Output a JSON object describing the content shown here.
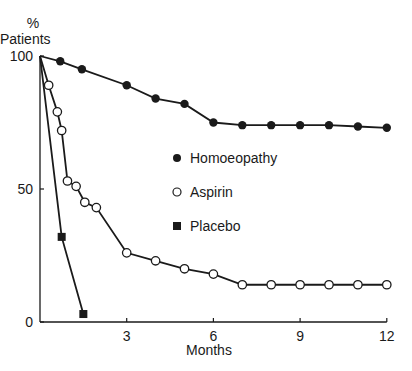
{
  "chart_data": {
    "type": "line",
    "title": "",
    "xlabel": "Months",
    "ylabel": "% Patients",
    "ylabel_line1": "%",
    "ylabel_line2": "Patients",
    "xlim": [
      0,
      12
    ],
    "ylim": [
      0,
      100
    ],
    "xticks": [
      3,
      6,
      9,
      12
    ],
    "yticks": [
      0,
      50,
      100
    ],
    "grid": false,
    "legend_position": "center-right",
    "series": [
      {
        "name": "Homoeopathy",
        "marker": "filled-circle",
        "x": [
          0,
          0.7,
          1.45,
          3,
          4,
          5,
          6,
          7,
          8,
          9,
          10,
          11,
          12
        ],
        "y": [
          100,
          98,
          95,
          89,
          84,
          82,
          75,
          74,
          74,
          74,
          74,
          73.5,
          73
        ]
      },
      {
        "name": "Aspirin",
        "marker": "open-circle",
        "x": [
          0,
          0.3,
          0.6,
          0.75,
          0.95,
          1.25,
          1.55,
          1.95,
          3,
          4,
          5,
          6,
          7,
          8,
          9,
          10,
          11,
          12
        ],
        "y": [
          100,
          89,
          79,
          72,
          53,
          51,
          45,
          43,
          26,
          23,
          20,
          18,
          14,
          14,
          14,
          14,
          14,
          14
        ]
      },
      {
        "name": "Placebo",
        "marker": "filled-square",
        "x": [
          0,
          0.75,
          1.5
        ],
        "y": [
          100,
          32,
          3
        ]
      }
    ]
  }
}
